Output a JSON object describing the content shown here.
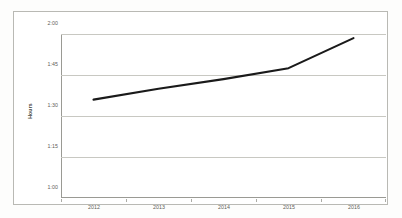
{
  "chart_data": {
    "type": "line",
    "title": "",
    "subtitle": "",
    "xlabel": "",
    "ylabel": "Hours",
    "categories": [
      "2012",
      "2013",
      "2014",
      "2015",
      "2016"
    ],
    "x": [
      2012,
      2013,
      2014,
      2015,
      2016
    ],
    "y_tick_labels": [
      "1:00",
      "1:15",
      "1:30",
      "1:45",
      "2:00"
    ],
    "y_tick_values": [
      60,
      75,
      90,
      105,
      120
    ],
    "ylim": [
      60,
      120
    ],
    "ylim_labels": [
      "1:00",
      "2:00"
    ],
    "y_unit": "hours:minutes",
    "grid": true,
    "legend": false,
    "legend_position": "none",
    "markers": false,
    "series": [
      {
        "name": "Hours",
        "color": "#1a1a1a",
        "values": [
          96,
          100,
          103.5,
          107.5,
          118.5
        ],
        "value_labels": [
          "1:36",
          "1:40",
          "1:43",
          "1:47",
          "1:58"
        ]
      }
    ]
  },
  "axes": {
    "y_title": "Hours",
    "y_ticks": [
      {
        "label": "2:00",
        "value": 120
      },
      {
        "label": "1:45",
        "value": 105
      },
      {
        "label": "1:30",
        "value": 90
      },
      {
        "label": "1:15",
        "value": 75
      },
      {
        "label": "1:00",
        "value": 60
      }
    ],
    "x_ticks": [
      {
        "label": "2012"
      },
      {
        "label": "2013"
      },
      {
        "label": "2014"
      },
      {
        "label": "2015"
      },
      {
        "label": "2016"
      }
    ]
  },
  "style": {
    "plot_background": "#ffffff",
    "frame_border": "#b9b9b4",
    "gridline_color": "#c8c8c2",
    "axis_color": "#9a9a94",
    "series_color": "#1a1a1a",
    "tick_text_color": "#5e5e58"
  }
}
